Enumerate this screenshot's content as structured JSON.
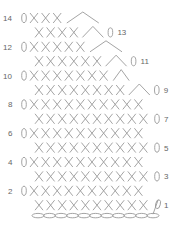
{
  "diagram": {
    "type": "crochet-chart",
    "symbols": {
      "single_crochet": "X",
      "chain": "0",
      "decrease": "^",
      "foundation_chain": "oval"
    },
    "foundation_chain_count": 11,
    "rows": [
      {
        "number": 14,
        "side": "left",
        "sc": 3,
        "decrease": true,
        "turning_chain": true
      },
      {
        "number": 13,
        "side": "right",
        "sc": 4,
        "decrease": true,
        "turning_chain": true
      },
      {
        "number": 12,
        "side": "left",
        "sc": 5,
        "decrease": true,
        "turning_chain": true
      },
      {
        "number": 11,
        "side": "right",
        "sc": 6,
        "decrease": true,
        "turning_chain": true
      },
      {
        "number": 10,
        "side": "left",
        "sc": 7,
        "decrease": true,
        "turning_chain": true
      },
      {
        "number": 9,
        "side": "right",
        "sc": 8,
        "decrease": true,
        "turning_chain": true
      },
      {
        "number": 8,
        "side": "left",
        "sc": 10,
        "decrease": false,
        "turning_chain": true
      },
      {
        "number": 7,
        "side": "right",
        "sc": 10,
        "decrease": false,
        "turning_chain": true
      },
      {
        "number": 6,
        "side": "left",
        "sc": 10,
        "decrease": false,
        "turning_chain": true
      },
      {
        "number": 5,
        "side": "right",
        "sc": 10,
        "decrease": false,
        "turning_chain": true
      },
      {
        "number": 4,
        "side": "left",
        "sc": 10,
        "decrease": false,
        "turning_chain": true
      },
      {
        "number": 3,
        "side": "right",
        "sc": 10,
        "decrease": false,
        "turning_chain": true
      },
      {
        "number": 2,
        "side": "left",
        "sc": 10,
        "decrease": false,
        "turning_chain": true
      },
      {
        "number": 1,
        "side": "right",
        "sc": 10,
        "decrease": false,
        "turning_chain": true
      }
    ],
    "labels": [
      "14",
      "13",
      "12",
      "11",
      "10",
      "9",
      "8",
      "7",
      "6",
      "5",
      "4",
      "3",
      "2",
      "1"
    ]
  }
}
